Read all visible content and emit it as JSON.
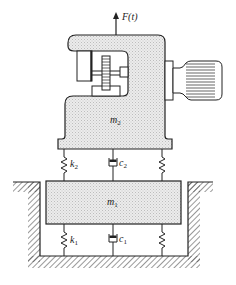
{
  "diagram": {
    "force_label": "F(t)",
    "mass_top": {
      "symbol": "m",
      "sub": "2"
    },
    "mass_bottom": {
      "symbol": "m",
      "sub": "1"
    },
    "spring_upper": {
      "symbol": "k",
      "sub": "2"
    },
    "damper_upper": {
      "symbol": "c",
      "sub": "2"
    },
    "spring_lower": {
      "symbol": "k",
      "sub": "1"
    },
    "damper_lower": {
      "symbol": "c",
      "sub": "1"
    },
    "colors": {
      "line": "#222222",
      "fill": "#e4e4e4",
      "background": "#ffffff"
    }
  }
}
